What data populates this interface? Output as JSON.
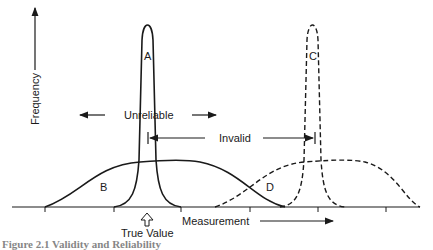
{
  "diagram": {
    "y_axis_label": "Frequency",
    "x_axis_label": "Measurement",
    "true_value_label": "True Value",
    "curves": [
      {
        "id": "A",
        "label": "A",
        "style": "solid",
        "shape": "narrow",
        "description": "reliable and valid"
      },
      {
        "id": "B",
        "label": "B",
        "style": "solid",
        "shape": "wide",
        "description": "unreliable but valid"
      },
      {
        "id": "C",
        "label": "C",
        "style": "dashed",
        "shape": "narrow",
        "description": "reliable but invalid"
      },
      {
        "id": "D",
        "label": "D",
        "style": "dashed",
        "shape": "wide",
        "description": "unreliable and invalid"
      }
    ],
    "annotations": {
      "unreliable": "Unreliable",
      "invalid": "Invalid"
    },
    "caption": "Figure 2.1  Validity and Reliability"
  }
}
